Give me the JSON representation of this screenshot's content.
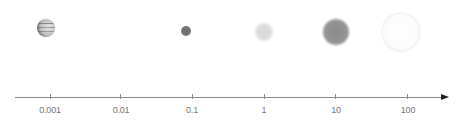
{
  "diagram": {
    "axis": {
      "scale": "log",
      "arrow": "right",
      "ticks": [
        {
          "label": "0.001",
          "x": 50
        },
        {
          "label": "0.01",
          "x": 120
        },
        {
          "label": "0.1",
          "x": 192
        },
        {
          "label": "1",
          "x": 264
        },
        {
          "label": "10",
          "x": 335
        },
        {
          "label": "100",
          "x": 407
        }
      ]
    },
    "objects": [
      {
        "name": "banded-planet",
        "position_approx": "0.001"
      },
      {
        "name": "small-dark-dot",
        "position_approx": "0.1"
      },
      {
        "name": "light-blurry-disc",
        "position_approx": "1"
      },
      {
        "name": "mid-gray-disc",
        "position_approx": "10"
      },
      {
        "name": "large-white-ring",
        "position_approx": "100"
      }
    ],
    "colors": {
      "axis": "#8a8a8a",
      "arrow": "#222222",
      "label": "#777777"
    }
  }
}
